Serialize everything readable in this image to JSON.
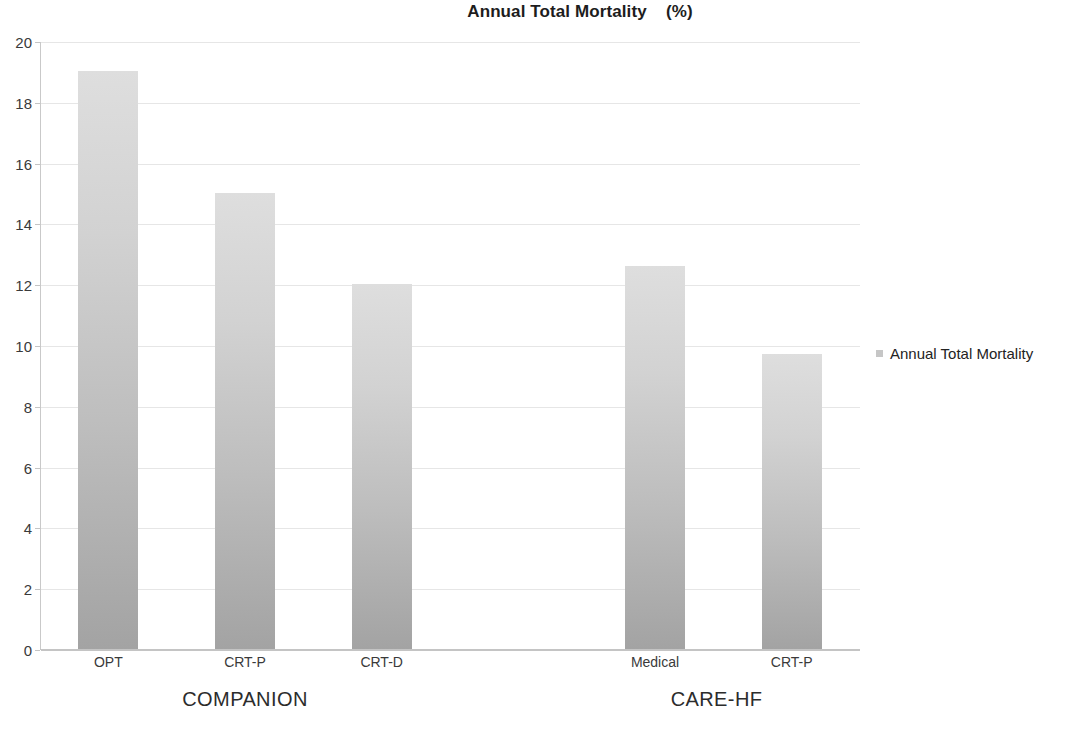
{
  "chart_data": {
    "type": "bar",
    "title": "Annual Total Mortality    (%)",
    "title_main": "Annual Total Mortality",
    "title_unit": "(%)",
    "xlabel": "",
    "ylabel": "",
    "ylim": [
      0,
      20
    ],
    "ytick_step": 2,
    "grid": true,
    "legend_position": "right",
    "categories": [
      "OPT",
      "CRT-P",
      "CRT-D",
      "",
      "Medical",
      "CRT-P"
    ],
    "values": [
      19,
      15,
      12,
      null,
      12.6,
      9.7
    ],
    "series": [
      {
        "name": "Annual Total Mortality",
        "values": [
          19,
          15,
          12,
          null,
          12.6,
          9.7
        ]
      }
    ],
    "ytick_labels": [
      "0",
      "2",
      "4",
      "6",
      "8",
      "10",
      "12",
      "14",
      "16",
      "18",
      "20"
    ],
    "ytick_values": [
      0,
      2,
      4,
      6,
      8,
      10,
      12,
      14,
      16,
      18,
      20
    ],
    "bars": [
      {
        "label": "OPT",
        "value": 19,
        "group": "COMPANION"
      },
      {
        "label": "CRT-P",
        "value": 15,
        "group": "COMPANION"
      },
      {
        "label": "CRT-D",
        "value": 12,
        "group": "COMPANION"
      },
      {
        "label": "Medical",
        "value": 12.6,
        "group": "CARE-HF"
      },
      {
        "label": "CRT-P",
        "value": 9.7,
        "group": "CARE-HF"
      }
    ],
    "groups": [
      {
        "label": "COMPANION"
      },
      {
        "label": "CARE-HF"
      }
    ],
    "legend": [
      {
        "label": "Annual Total Mortality",
        "color": "#c6c6c6"
      }
    ],
    "colors": {
      "bar_top": "#dedede",
      "bar_bottom": "#a3a3a3",
      "gridline": "#e6e6e6",
      "axis": "#c4c4c4",
      "text": "#2a2a2a",
      "background": "#ffffff"
    }
  }
}
